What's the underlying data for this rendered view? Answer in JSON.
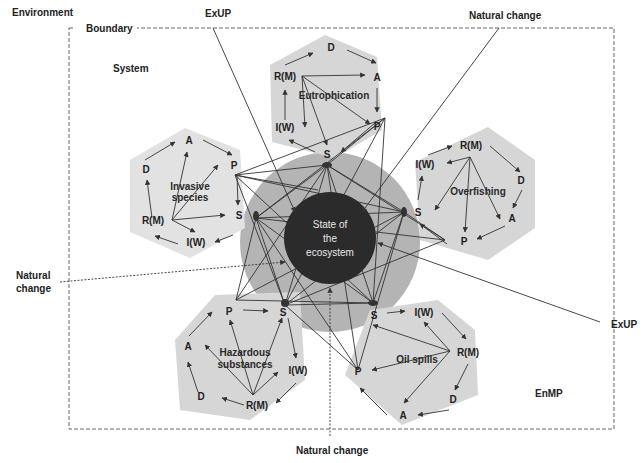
{
  "labels": {
    "environment": "Environment",
    "boundary": "Boundary",
    "system": "System",
    "enmp": "EnMP",
    "exup_top": "ExUP",
    "exup_right": "ExUP",
    "natural_change_top": "Natural change",
    "natural_change_left_1": "Natural",
    "natural_change_left_2": "change",
    "natural_change_bottom": "Natural change"
  },
  "center": {
    "line1": "State of",
    "line2": "the",
    "line3": "ecosystem"
  },
  "hexagons": {
    "eutrophication": {
      "title": "Eutrophication",
      "D": "D",
      "A": "A",
      "P": "P",
      "S": "S",
      "IW": "I(W)",
      "RM": "R(M)"
    },
    "invasive": {
      "title1": "Invasive",
      "title2": "species",
      "A": "A",
      "P": "P",
      "S": "S",
      "IW": "I(W)",
      "RM": "R(M)",
      "D": "D"
    },
    "overfishing": {
      "title": "Overfishing",
      "RM": "R(M)",
      "D": "D",
      "A": "A",
      "P": "P",
      "S": "S",
      "IW": "I(W)"
    },
    "hazardous": {
      "title1": "Hazardous",
      "title2": "substances",
      "P": "P",
      "S": "S",
      "IW": "I(W)",
      "RM": "R(M)",
      "D": "D",
      "A": "A"
    },
    "oilspills": {
      "title": "Oil spills",
      "S": "S",
      "IW": "I(W)",
      "RM": "R(M)",
      "D": "D",
      "A": "A",
      "P": "P"
    }
  },
  "colors": {
    "hexagon_fill": "#d6d6d6",
    "ring_fill": "#b4b4b4",
    "center_fill": "#2b2b2b",
    "arrow": "#333333",
    "boundary": "#666666"
  }
}
